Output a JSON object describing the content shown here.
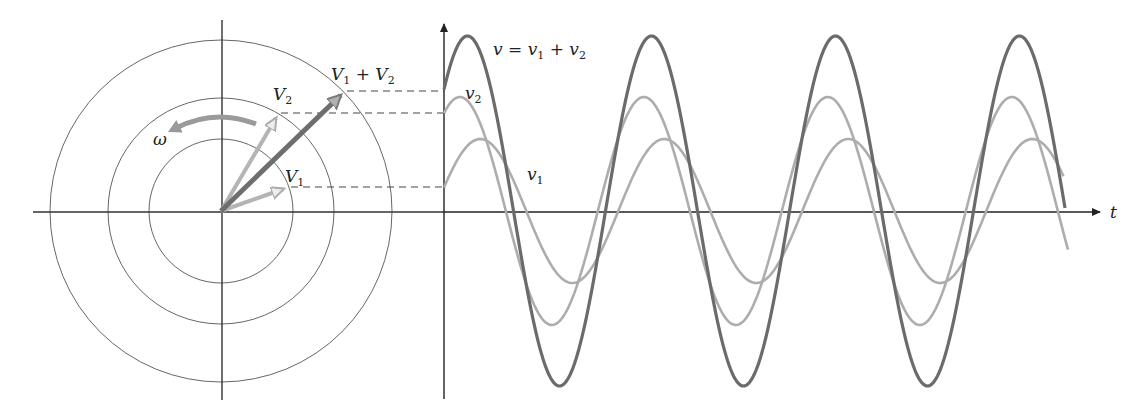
{
  "diagram": {
    "colors": {
      "axis": "#333333",
      "circle": "#555555",
      "dash": "#444444",
      "v_sum": "#6b6b6b",
      "v_components": "#adadad",
      "omega_arrow": "#9a9a9a",
      "background": "#ffffff"
    },
    "phasor_diagram": {
      "origin": [
        221,
        211
      ],
      "circle_radii": [
        72,
        113,
        171
      ],
      "phasors": [
        {
          "name": "V1",
          "label": "V",
          "subscript": "1",
          "tip": [
            289,
            187
          ],
          "magnitude_px": 72,
          "angle_deg": 19
        },
        {
          "name": "V2",
          "label": "V",
          "subscript": "2",
          "tip": [
            279,
            113
          ],
          "magnitude_px": 114,
          "angle_deg": 59
        },
        {
          "name": "V1+V2",
          "label_parts": [
            "V",
            "1",
            " + V",
            "2"
          ],
          "tip": [
            345,
            91
          ],
          "magnitude_px": 174,
          "angle_deg": 44
        }
      ],
      "rotation_label": "ω"
    },
    "waveforms": {
      "t_axis_label": "t",
      "origin": [
        444,
        211
      ],
      "period_px": 184,
      "labels": {
        "sum": {
          "main": "v = v",
          "s1": "1",
          "plus": " + v",
          "s2": "2"
        },
        "v2": {
          "main": "v",
          "sub": "2"
        },
        "v1": {
          "main": "v",
          "sub": "1"
        }
      }
    }
  },
  "chart_data": {
    "type": "line",
    "title": "",
    "xlabel": "t",
    "ylabel": "",
    "series": [
      {
        "name": "v = v1 + v2",
        "amplitude": 175,
        "phase_deg": 44,
        "cycles_shown": 3.4
      },
      {
        "name": "v2",
        "amplitude": 114,
        "phase_deg": 59,
        "cycles_shown": 3.4
      },
      {
        "name": "v1",
        "amplitude": 72,
        "phase_deg": 19,
        "cycles_shown": 3.4
      }
    ],
    "annotations": [
      "V1",
      "V2",
      "V1 + V2",
      "ω",
      "v = v1 + v2",
      "v2",
      "v1",
      "t"
    ],
    "grid": false
  }
}
